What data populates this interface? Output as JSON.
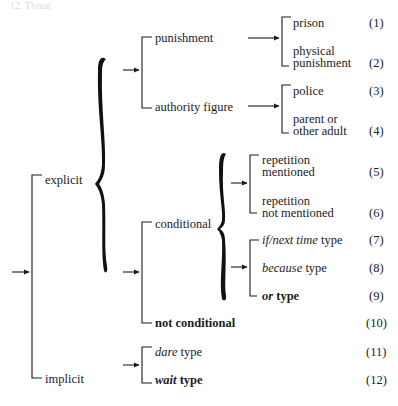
{
  "header": "12. Threat",
  "root": {
    "children": [
      {
        "label": "explicit",
        "children": [
          {
            "group": "punishment-authority",
            "items": [
              {
                "label": "punishment",
                "leaves": [
                  {
                    "label_lines": [
                      "prison"
                    ],
                    "code": "(1)"
                  },
                  {
                    "label_lines": [
                      "physical",
                      "punishment"
                    ],
                    "code": "(2)"
                  }
                ]
              },
              {
                "label": "authority figure",
                "leaves": [
                  {
                    "label_lines": [
                      "police"
                    ],
                    "code": "(3)"
                  },
                  {
                    "label_lines": [
                      "parent or",
                      "other adult"
                    ],
                    "code": "(4)"
                  }
                ]
              }
            ]
          },
          {
            "group": "conditionality",
            "items": [
              {
                "label": "conditional",
                "sub_groups": [
                  {
                    "leaves": [
                      {
                        "label_lines": [
                          "repetition",
                          "mentioned"
                        ],
                        "code": "(5)"
                      },
                      {
                        "label_lines": [
                          "repetition",
                          "not mentioned"
                        ],
                        "code": "(6)"
                      }
                    ]
                  },
                  {
                    "leaves": [
                      {
                        "italic": "if/next time",
                        "plain": " type",
                        "code": "(7)"
                      },
                      {
                        "italic": "because",
                        "plain": " type",
                        "code": "(8)"
                      },
                      {
                        "italic": "or",
                        "plain": " type",
                        "code": "(9)"
                      }
                    ]
                  }
                ]
              },
              {
                "label": "not conditional",
                "code": "(10)"
              }
            ]
          }
        ]
      },
      {
        "label": "implicit",
        "leaves": [
          {
            "italic": "dare",
            "plain": " type",
            "code": "(11)"
          },
          {
            "italic": "wait",
            "plain": " type",
            "code": "(12)"
          }
        ]
      }
    ]
  },
  "colors": {
    "ink": "#1c1c1c",
    "background": "#ffffff"
  }
}
